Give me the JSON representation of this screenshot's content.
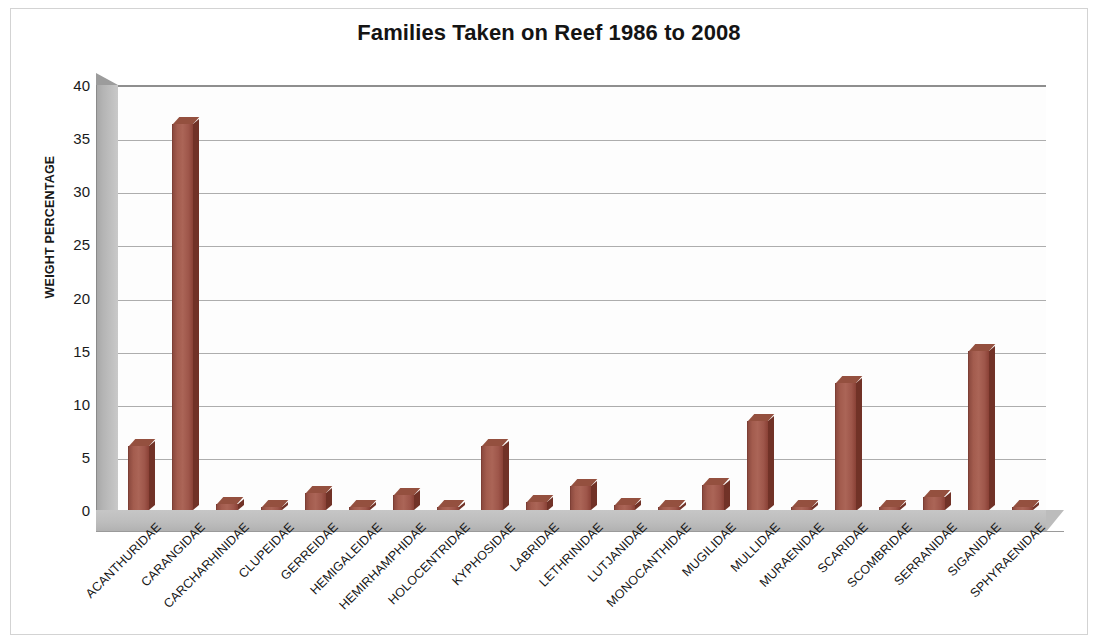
{
  "chart_data": {
    "type": "bar",
    "title": "Families Taken on Reef 1986 to 2008",
    "xlabel": "",
    "ylabel": "WEIGHT PERCENTAGE",
    "ylim": [
      0,
      40
    ],
    "ytick_step": 5,
    "yticks": [
      0,
      5,
      10,
      15,
      20,
      25,
      30,
      35,
      40
    ],
    "grid": true,
    "legend": false,
    "style": "3d-column",
    "bar_color": "#a35c4e",
    "categories": [
      "ACANTHURIDAE",
      "CARANGIDAE",
      "CARCHARHINIDAE",
      "CLUPEIDAE",
      "GERREIDAE",
      "HEMIGALEIDAE",
      "HEMIRHAMPHIDAE",
      "HOLOCENTRIDAE",
      "KYPHOSIDAE",
      "LABRIDAE",
      "LETHRINIDAE",
      "LUTJANIDAE",
      "MONOCANTHIDAE",
      "MUGILIDAE",
      "MULLIDAE",
      "MURAENIDAE",
      "SCARIDAE",
      "SCOMBRIDAE",
      "SERRANIDAE",
      "SIGANIDAE",
      "SPHYRAENIDAE"
    ],
    "values": [
      6.0,
      36.3,
      0.6,
      0.3,
      1.6,
      0.2,
      1.4,
      0.3,
      6.0,
      0.8,
      2.3,
      0.5,
      0.3,
      2.4,
      8.4,
      0.3,
      12.0,
      0.2,
      1.2,
      15.0,
      0.3
    ]
  },
  "colors": {
    "bar": "#a35c4e",
    "bar_shadow": "#713227",
    "bar_top": "#94503f",
    "wall": "#bdbdbd",
    "gridline": "#adadad",
    "text": "#141414",
    "frame": "#d3d3d3"
  }
}
